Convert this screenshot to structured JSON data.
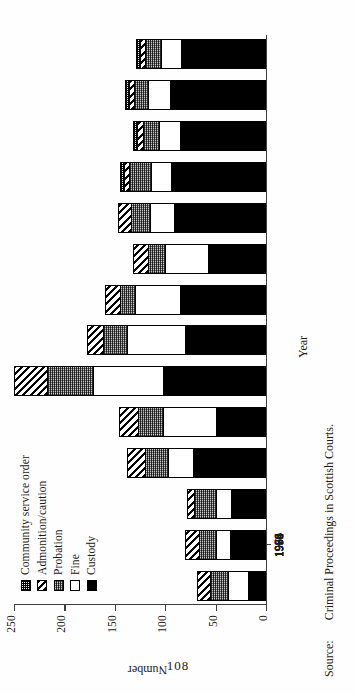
{
  "page": {
    "number": "108"
  },
  "source": {
    "key": "Source:",
    "text": "Criminal Proceedings in Scottish Courts."
  },
  "legend": {
    "items": [
      {
        "label": "Community service order",
        "pattern": "checker-fine",
        "icon": "legend-swatch-cso"
      },
      {
        "label": "Admonition/caution",
        "pattern": "diagonal-stripe",
        "icon": "legend-swatch-admonition"
      },
      {
        "label": "Probation",
        "pattern": "stipple-grey",
        "icon": "legend-swatch-probation"
      },
      {
        "label": "Fine",
        "pattern": "solid-white",
        "icon": "legend-swatch-fine"
      },
      {
        "label": "Custody",
        "pattern": "solid-black",
        "icon": "legend-swatch-custody"
      }
    ]
  },
  "chart_data": {
    "type": "bar",
    "subtype": "stacked-bar",
    "title": "",
    "xlabel": "Year",
    "ylabel": "Number",
    "ylim": [
      0,
      250
    ],
    "yticks": [
      0,
      50,
      100,
      150,
      200,
      250
    ],
    "ytick_labels": [
      "0",
      "50",
      "100",
      "150",
      "200",
      "250"
    ],
    "grid": false,
    "legend_position": "top-left-inside",
    "orientation": "vertical-bars-printed-sideways",
    "categories": [
      "1950",
      "1954",
      "1958",
      "1962",
      "1966",
      "1970",
      "1974",
      "1978",
      "1982",
      "1986",
      "1990",
      "1992",
      "1993",
      "1994"
    ],
    "series": [
      {
        "name": "Custody",
        "values": [
          18,
          36,
          35,
          72,
          50,
          102,
          80,
          85,
          58,
          91,
          94,
          85,
          95,
          84
        ]
      },
      {
        "name": "Fine",
        "values": [
          20,
          14,
          15,
          25,
          52,
          70,
          58,
          45,
          42,
          24,
          20,
          21,
          22,
          20
        ]
      },
      {
        "name": "Probation",
        "values": [
          18,
          16,
          21,
          23,
          25,
          45,
          24,
          15,
          17,
          19,
          22,
          16,
          14,
          16
        ]
      },
      {
        "name": "Admonition/caution",
        "values": [
          12,
          14,
          7,
          18,
          19,
          33,
          16,
          15,
          15,
          13,
          5,
          6,
          5,
          5
        ]
      },
      {
        "name": "Community service order",
        "values": [
          0,
          0,
          0,
          0,
          0,
          0,
          0,
          0,
          0,
          0,
          4,
          4,
          4,
          4
        ]
      }
    ],
    "totals": [
      68,
      80,
      78,
      138,
      146,
      250,
      178,
      160,
      132,
      147,
      145,
      132,
      140,
      129
    ]
  }
}
